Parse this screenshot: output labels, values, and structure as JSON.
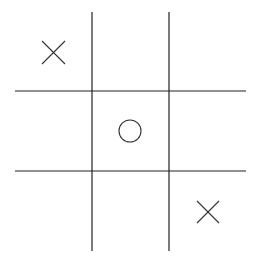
{
  "game": {
    "name": "tic-tac-toe",
    "grid_size": 3,
    "line_color": "#222222",
    "mark_color": "#333333",
    "cells": [
      [
        "X",
        "",
        ""
      ],
      [
        "",
        "O",
        ""
      ],
      [
        "",
        "",
        "X"
      ]
    ]
  }
}
